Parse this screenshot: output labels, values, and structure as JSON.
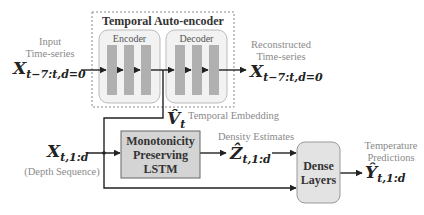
{
  "autoencoder": {
    "title": "Temporal Auto-encoder",
    "encoder_label": "Encoder",
    "decoder_label": "Decoder"
  },
  "input": {
    "caption_line1": "Input",
    "caption_line2": "Time-series",
    "symbol": "X",
    "subscript": "t−7:t,d=0"
  },
  "output_recon": {
    "caption_line1": "Reconstructed",
    "caption_line2": "Time-series",
    "symbol": "X",
    "subscript": "t−7:t,d=0"
  },
  "embedding": {
    "symbol": "V̂",
    "subscript": "t",
    "caption": "Temporal Embedding"
  },
  "depth_input": {
    "symbol": "X",
    "subscript": "t,1:d",
    "caption": "(Depth Sequence)"
  },
  "lstm": {
    "line1": "Monotonicity",
    "line2": "Preserving",
    "line3": "LSTM"
  },
  "density": {
    "caption": "Density Estimates",
    "symbol": "Ẑ",
    "subscript": "t,1:d"
  },
  "dense": {
    "line1": "Dense",
    "line2": "Layers"
  },
  "prediction": {
    "caption_line1": "Temperature",
    "caption_line2": "Predictions",
    "symbol": "Ŷ",
    "subscript": "t,1:d"
  }
}
